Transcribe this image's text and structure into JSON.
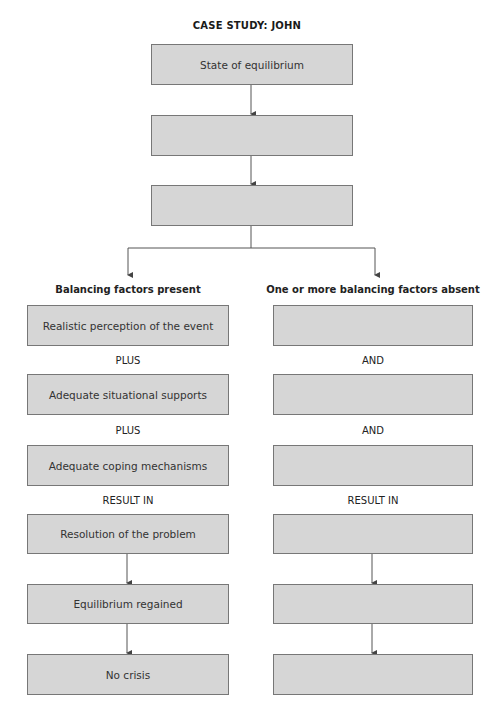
{
  "title": "CASE STUDY:  JOHN",
  "top_chain": [
    {
      "text": "State of equilibrium"
    },
    {
      "text": ""
    },
    {
      "text": ""
    }
  ],
  "left": {
    "heading": "Balancing factors present",
    "boxes": [
      {
        "text": "Realistic perception of the event"
      },
      {
        "text": "Adequate situational supports"
      },
      {
        "text": "Adequate coping mechanisms"
      },
      {
        "text": "Resolution of the problem"
      },
      {
        "text": "Equilibrium regained"
      },
      {
        "text": "No crisis"
      }
    ],
    "connectors": [
      "PLUS",
      "PLUS",
      "RESULT IN"
    ]
  },
  "right": {
    "heading": "One or more balancing factors absent",
    "boxes": [
      {
        "text": ""
      },
      {
        "text": ""
      },
      {
        "text": ""
      },
      {
        "text": ""
      },
      {
        "text": ""
      },
      {
        "text": ""
      }
    ],
    "connectors": [
      "AND",
      "AND",
      "RESULT IN"
    ]
  },
  "colors": {
    "box_fill": "#d6d6d6",
    "box_border": "#777777",
    "line": "#555555",
    "text": "#333333"
  }
}
